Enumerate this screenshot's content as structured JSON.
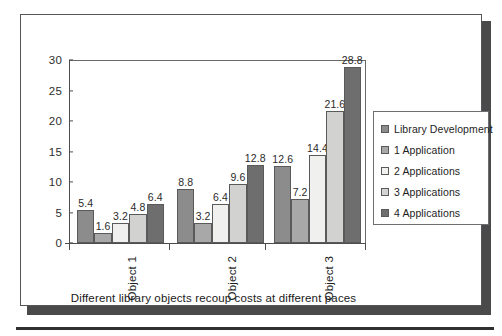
{
  "chart_data": {
    "type": "bar",
    "title": "",
    "caption": "Different library objects recoup costs at different paces",
    "xlabel": "",
    "ylabel": "",
    "ylim": [
      0,
      30
    ],
    "yticks": [
      0,
      5,
      10,
      15,
      20,
      25,
      30
    ],
    "grid": false,
    "legend_position": "right",
    "categories": [
      "Object 1",
      "Object 2",
      "Object 3"
    ],
    "series": [
      {
        "name": "Library Development",
        "color": "#8c8c8c",
        "values": [
          5.4,
          8.8,
          12.6
        ],
        "labels": [
          "5.4",
          "8.8",
          "12.6"
        ]
      },
      {
        "name": "1 Application",
        "color": "#a8a8a8",
        "values": [
          1.6,
          3.2,
          7.2
        ],
        "labels": [
          "1.6",
          "3.2",
          "7.2"
        ]
      },
      {
        "name": "2 Applications",
        "color": "#f0f0ee",
        "values": [
          3.2,
          6.4,
          14.4
        ],
        "labels": [
          "3.2",
          "6.4",
          "14.4"
        ]
      },
      {
        "name": "3 Applications",
        "color": "#d2d2d0",
        "values": [
          4.8,
          9.6,
          21.6
        ],
        "labels": [
          "4.8",
          "9.6",
          "21.6"
        ]
      },
      {
        "name": "4 Applications",
        "color": "#6e6e6e",
        "values": [
          6.4,
          12.8,
          28.8
        ],
        "labels": [
          "6.4",
          "12.8",
          "28.8"
        ]
      }
    ]
  }
}
